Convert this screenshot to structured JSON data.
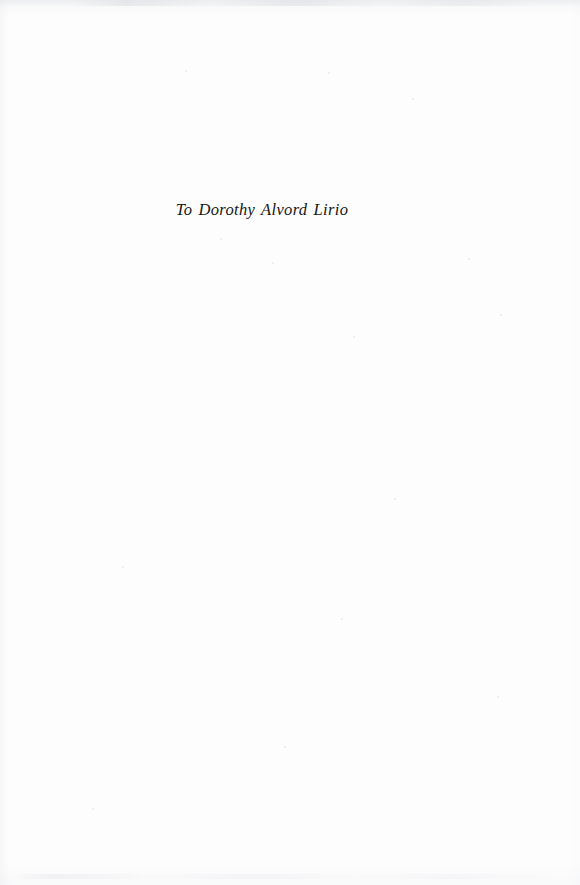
{
  "page": {
    "kind": "book-dedication-page",
    "background_color": "#fdfdfd",
    "width": 580,
    "height": 885
  },
  "dedication": {
    "text": "To Dorothy Alvord Lirio",
    "style": "italic-serif",
    "text_color": "#151515",
    "alignment": "center"
  },
  "artifacts": {
    "top_edge_shadow_color": "#e1e2e5",
    "bottom_edge_shadow_color": "#eceded",
    "speck_color": "#cdcfd4"
  }
}
